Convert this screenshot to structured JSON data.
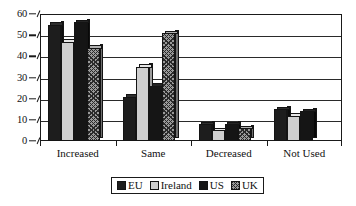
{
  "chart_data": {
    "type": "bar",
    "title": "",
    "subtitle": "",
    "xlabel": "",
    "ylabel": "",
    "ylim": [
      0,
      60
    ],
    "ytick_step": 10,
    "grid": true,
    "legend_position": "bottom",
    "categories": [
      "Increased",
      "Same",
      "Decreased",
      "Not Used"
    ],
    "ytick_labels": [
      "0",
      "10",
      "20",
      "30",
      "40",
      "50",
      "60"
    ],
    "series": [
      {
        "name": "EU",
        "fill": "solid",
        "values": [
          55,
          21,
          8,
          15
        ]
      },
      {
        "name": "Ireland",
        "fill": "light",
        "values": [
          47,
          35,
          5,
          12
        ]
      },
      {
        "name": "US",
        "fill": "dark",
        "values": [
          56,
          26,
          8,
          14
        ]
      },
      {
        "name": "UK",
        "fill": "hatch",
        "values": [
          44,
          51,
          6,
          0
        ]
      }
    ]
  },
  "legend": {
    "items": [
      {
        "label": "EU",
        "fill": "solid"
      },
      {
        "label": "Ireland",
        "fill": "light"
      },
      {
        "label": "US",
        "fill": "dark"
      },
      {
        "label": "UK",
        "fill": "hatch"
      }
    ]
  },
  "colors": {
    "solid": "#1d1d1d",
    "light": "#cfcfcf",
    "dark": "#151515",
    "hatch": "#9a9a9a",
    "axis": "#1a1a1a",
    "background": "#ffffff"
  }
}
